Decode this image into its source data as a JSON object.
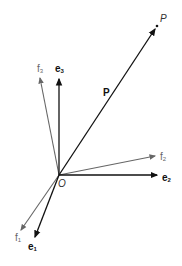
{
  "diagram": {
    "origin": {
      "label": "O",
      "x": 59,
      "y": 175
    },
    "point": {
      "label": "P",
      "x": 157,
      "y": 26
    },
    "position_vector": {
      "label": "P",
      "color": "#111111"
    },
    "basis_e": [
      {
        "base": "e",
        "sub": "1",
        "to": [
          34,
          239
        ],
        "color": "#111111"
      },
      {
        "base": "e",
        "sub": "2",
        "to": [
          159,
          176
        ],
        "color": "#111111"
      },
      {
        "base": "e",
        "sub": "3",
        "to": [
          59,
          77
        ],
        "color": "#111111"
      }
    ],
    "basis_f": [
      {
        "base": "f",
        "sub": "1",
        "to": [
          20,
          232
        ],
        "color": "#666666"
      },
      {
        "base": "f",
        "sub": "2",
        "to": [
          156,
          156
        ],
        "color": "#666666"
      },
      {
        "base": "f",
        "sub": "3",
        "to": [
          40,
          76
        ],
        "color": "#666666"
      }
    ]
  }
}
